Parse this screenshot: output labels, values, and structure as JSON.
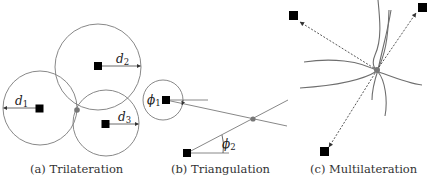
{
  "figure": {
    "panels": [
      {
        "id": "a",
        "caption": "(a) Trilateration",
        "labels": {
          "d1": "d",
          "d1_sub": "1",
          "d2": "d",
          "d2_sub": "2",
          "d3": "d",
          "d3_sub": "3"
        }
      },
      {
        "id": "b",
        "caption": "(b) Triangulation",
        "labels": {
          "phi1": "ϕ",
          "phi1_sub": "1",
          "phi2": "ϕ",
          "phi2_sub": "2"
        }
      },
      {
        "id": "c",
        "caption": "(c) Multilateration"
      }
    ],
    "colors": {
      "anchor": "#000000",
      "estimate_dot": "#777777",
      "circle_stroke": "#7a7a7a"
    }
  }
}
